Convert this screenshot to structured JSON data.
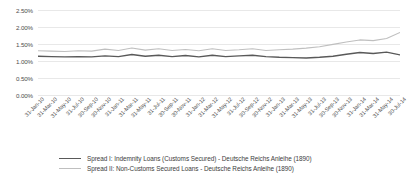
{
  "chart_data": {
    "type": "line",
    "title": "",
    "xlabel": "",
    "ylabel": "",
    "ylim": [
      0.0,
      2.5
    ],
    "ytick_format": "percent",
    "grid": true,
    "legend_position": "bottom",
    "yticks": [
      "0.00%",
      "0.50%",
      "1.00%",
      "1.50%",
      "2.00%",
      "2.50%"
    ],
    "ytick_values": [
      0.0,
      0.5,
      1.0,
      1.5,
      2.0,
      2.5
    ],
    "categories": [
      "31-Jan-10",
      "31-Mar-10",
      "31-May-10",
      "31-Jul-10",
      "30-Sep-10",
      "30-Nov-10",
      "31-Jan-11",
      "31-Mar-11",
      "31-May-11",
      "31-Jul-11",
      "30-Sep-11",
      "30-Nov-11",
      "31-Jan-12",
      "31-Mar-12",
      "31-May-12",
      "31-Jul-12",
      "30-Sep-12",
      "30-Nov-12",
      "31-Jan-13",
      "31-Mar-13",
      "31-May-13",
      "31-Jul-13",
      "30-Sep-13",
      "30-Nov-13",
      "31-Jan-14",
      "31-Mar-14",
      "31-May-14",
      "30-Jul-14"
    ],
    "series": [
      {
        "name": "Spread I: Indemnity Loans (Customs Secured) - Deutsche Reichs Anleihe (1890)",
        "color": "#595959",
        "width": 1.4,
        "values": [
          1.14,
          1.13,
          1.12,
          1.13,
          1.12,
          1.15,
          1.13,
          1.19,
          1.14,
          1.17,
          1.13,
          1.16,
          1.12,
          1.17,
          1.13,
          1.15,
          1.17,
          1.13,
          1.11,
          1.1,
          1.09,
          1.11,
          1.14,
          1.2,
          1.25,
          1.22,
          1.26,
          1.18
        ]
      },
      {
        "name": "Spread II: Non-Customs Secured Loans - Deutsche Reichs Anleihe (1890)",
        "color": "#bfbfbf",
        "width": 1.1,
        "values": [
          1.3,
          1.29,
          1.28,
          1.3,
          1.29,
          1.35,
          1.31,
          1.38,
          1.32,
          1.36,
          1.31,
          1.34,
          1.3,
          1.36,
          1.31,
          1.33,
          1.36,
          1.31,
          1.33,
          1.35,
          1.38,
          1.42,
          1.49,
          1.56,
          1.62,
          1.6,
          1.66,
          1.84
        ]
      }
    ]
  },
  "legend": {
    "entries": [
      {
        "label": "Spread  I: Indemnity Loans (Customs Secured) - Deutsche Reichs Anleihe (1890)"
      },
      {
        "label": "Spread  II: Non-Customs Secured Loans - Deutsche Reichs Anleihe (1890)"
      }
    ]
  }
}
